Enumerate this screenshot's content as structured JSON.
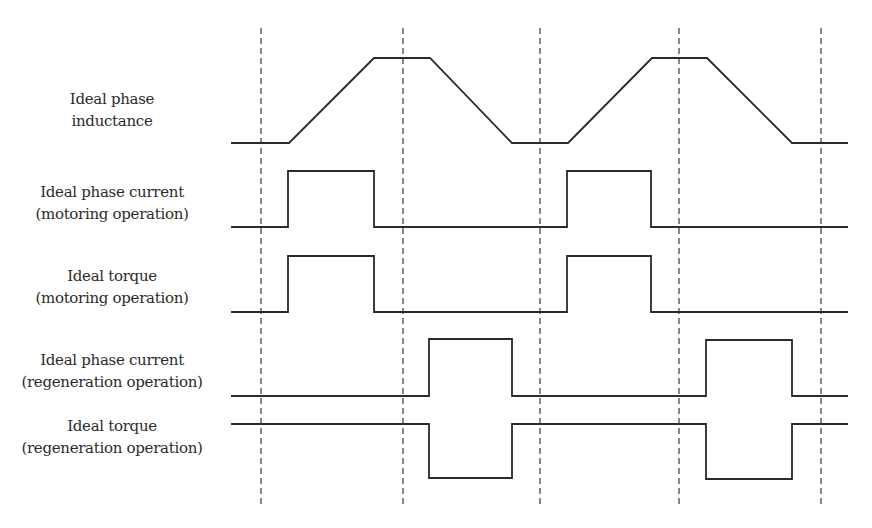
{
  "diagram": {
    "title": "",
    "colors": {
      "waveform": "#2a2a2a",
      "dashed": "#3a3a3a",
      "background": "#ffffff",
      "text": "#2b2b2b"
    },
    "signals": [
      {
        "id": "inductance",
        "label_lines": [
          "Ideal phase",
          "inductance"
        ]
      },
      {
        "id": "current-motoring",
        "label_lines": [
          "Ideal phase current",
          "(motoring operation)"
        ]
      },
      {
        "id": "torque-motoring",
        "label_lines": [
          "Ideal torque",
          "(motoring operation)"
        ]
      },
      {
        "id": "current-regen",
        "label_lines": [
          "Ideal phase current",
          "(regeneration operation)"
        ]
      },
      {
        "id": "torque-regen",
        "label_lines": [
          "Ideal torque",
          "(regeneration operation)"
        ]
      }
    ],
    "dashed_guides_x": [
      261,
      403,
      540,
      679,
      821
    ],
    "dashed_guides_y_range": [
      28,
      504
    ],
    "waveforms": {
      "inductance": [
        [
          231,
          143
        ],
        [
          289,
          143
        ],
        [
          374,
          58
        ],
        [
          430,
          58
        ],
        [
          512,
          143
        ],
        [
          568,
          143
        ],
        [
          652,
          58
        ],
        [
          707,
          58
        ],
        [
          792,
          143
        ],
        [
          848,
          143
        ]
      ],
      "current-motoring": [
        [
          231,
          227
        ],
        [
          288,
          227
        ],
        [
          288,
          171
        ],
        [
          374,
          171
        ],
        [
          374,
          227
        ],
        [
          567,
          227
        ],
        [
          567,
          171
        ],
        [
          651,
          171
        ],
        [
          651,
          227
        ],
        [
          848,
          227
        ]
      ],
      "torque-motoring": [
        [
          231,
          312
        ],
        [
          288,
          312
        ],
        [
          288,
          256
        ],
        [
          374,
          256
        ],
        [
          374,
          312
        ],
        [
          567,
          312
        ],
        [
          567,
          256
        ],
        [
          651,
          256
        ],
        [
          651,
          312
        ],
        [
          848,
          312
        ]
      ],
      "current-regen": [
        [
          231,
          396
        ],
        [
          429,
          396
        ],
        [
          429,
          339
        ],
        [
          512,
          339
        ],
        [
          512,
          396
        ],
        [
          706,
          396
        ],
        [
          706,
          340
        ],
        [
          792,
          340
        ],
        [
          792,
          396
        ],
        [
          848,
          396
        ]
      ],
      "torque-regen": [
        [
          231,
          424
        ],
        [
          429,
          424
        ],
        [
          429,
          478
        ],
        [
          512,
          478
        ],
        [
          512,
          424
        ],
        [
          706,
          424
        ],
        [
          706,
          479
        ],
        [
          792,
          479
        ],
        [
          792,
          424
        ],
        [
          848,
          424
        ]
      ]
    },
    "label_centers_y": [
      110,
      203,
      287,
      371,
      437
    ]
  }
}
